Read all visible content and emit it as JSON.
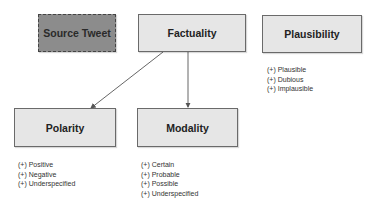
{
  "nodes": {
    "source_tweet": {
      "label": "Source Tweet",
      "style": "dashed",
      "fill": "#8c8c8c"
    },
    "factuality": {
      "label": "Factuality",
      "fill": "#e6e6e6"
    },
    "plausibility": {
      "label": "Plausibility",
      "fill": "#e6e6e6",
      "values": [
        "(+) Plausible",
        "(+) Dubious",
        "(+) Implausible"
      ]
    },
    "polarity": {
      "label": "Polarity",
      "fill": "#e6e6e6",
      "values": [
        "(+) Positive",
        "(+) Negative",
        "(+) Underspecified"
      ]
    },
    "modality": {
      "label": "Modality",
      "fill": "#e6e6e6",
      "values": [
        "(+) Certain",
        "(+) Probable",
        "(+) Possible",
        "(+) Underspecified"
      ]
    }
  },
  "edges": [
    {
      "from": "Factuality",
      "to": "Polarity"
    },
    {
      "from": "Factuality",
      "to": "Modality"
    }
  ]
}
